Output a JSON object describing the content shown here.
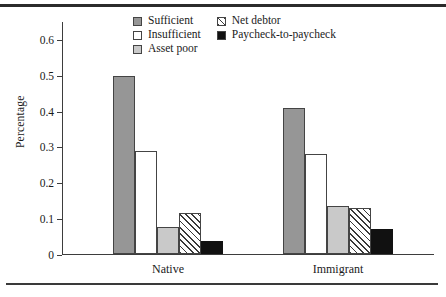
{
  "figure": {
    "has_top_rule": true,
    "has_bottom_rule": true
  },
  "chart_data": {
    "type": "bar",
    "title": "",
    "xlabel": "",
    "ylabel": "Percentage",
    "categories": [
      "Native",
      "Immigrant"
    ],
    "ylim": [
      0,
      0.65
    ],
    "yticks": [
      0,
      0.1,
      0.2,
      0.3,
      0.4,
      0.5,
      0.6
    ],
    "ytick_labels": [
      "0",
      "0.1",
      "0.2",
      "0.3",
      "0.4",
      "0.5",
      "0.6"
    ],
    "grid": false,
    "legend_position": "top-center",
    "series": [
      {
        "name": "Sufficient",
        "values": [
          0.498,
          0.407
        ],
        "fill": "#969696",
        "pattern": "solid",
        "edge": "#444444"
      },
      {
        "name": "Insufficient",
        "values": [
          0.287,
          0.278
        ],
        "fill": "#ffffff",
        "pattern": "solid",
        "edge": "#444444"
      },
      {
        "name": "Asset poor",
        "values": [
          0.075,
          0.133
        ],
        "fill": "#c9c9c9",
        "pattern": "solid",
        "edge": "#444444"
      },
      {
        "name": "Net debtor",
        "values": [
          0.114,
          0.127
        ],
        "fill": "#ffffff",
        "pattern": "diagonal-hatch",
        "edge": "#444444"
      },
      {
        "name": "Paycheck-to-paycheck",
        "values": [
          0.037,
          0.071
        ],
        "fill": "#111111",
        "pattern": "solid",
        "edge": "#111111"
      }
    ]
  },
  "legend": {
    "items": [
      {
        "label": "Sufficient",
        "style": "sty-solid-gray"
      },
      {
        "label": "Insufficient",
        "style": "sty-white"
      },
      {
        "label": "Asset poor",
        "style": "sty-light-gray"
      },
      {
        "label": "Net debtor",
        "style": "sty-hatch"
      },
      {
        "label": "Paycheck-to-paycheck",
        "style": "sty-black"
      }
    ]
  }
}
